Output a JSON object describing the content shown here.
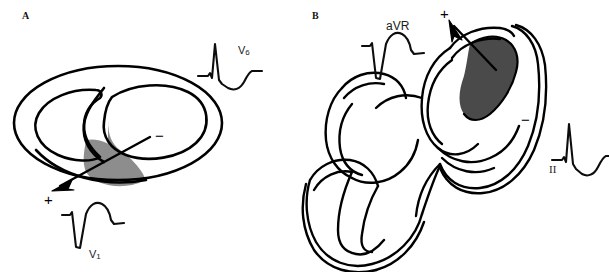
{
  "figure": {
    "background_color": "#ffffff",
    "ink_color": "#000000",
    "width": 609,
    "height": 272
  },
  "panels": [
    {
      "letter": "A",
      "name": "short-axis-cross-section",
      "view": "short-axis ventricular cross-section",
      "infarct": {
        "name": "septal-infarct-region",
        "fill_color": "#8d8d8d",
        "location": "septum / inferoseptal wall"
      },
      "vector": {
        "name": "depolarization-vector",
        "direction": "inferolateral, down-left",
        "positive_label": "+",
        "negative_label": "−"
      },
      "ecgs": [
        {
          "lead": "V",
          "subscript": "6",
          "name": "ecg-trace-v6",
          "morphology": "tall upright R wave with S descent and positive T wave",
          "deflection": "positive"
        },
        {
          "lead": "V",
          "subscript": "1",
          "name": "ecg-trace-v1",
          "morphology": "deep negative QS complex with broad positive T wave",
          "deflection": "negative"
        }
      ]
    },
    {
      "letter": "B",
      "name": "long-axis-helical-view",
      "view": "long-axis helical ventricular band view",
      "infarct": {
        "name": "basal-infarct-region",
        "fill_color": "#4a4a4a",
        "location": "basal anterolateral wall"
      },
      "vector": {
        "name": "depolarization-vector",
        "direction": "superior, up-left",
        "positive_label": "+",
        "negative_label": "−"
      },
      "ecgs": [
        {
          "lead": "aVR",
          "subscript": "",
          "name": "ecg-trace-avr",
          "morphology": "deep negative QS complex with rounded T wave",
          "deflection": "negative"
        },
        {
          "lead": "II",
          "subscript": "",
          "name": "ecg-trace-ii",
          "morphology": "tall upright R wave with S dip and positive T wave",
          "deflection": "positive"
        }
      ]
    }
  ],
  "labels": {
    "panel_a": "A",
    "panel_b": "B",
    "v6_lead": "V",
    "v6_sub": "6",
    "v1_lead": "V",
    "v1_sub": "1",
    "avr_lead": "aVR",
    "ii_lead": "II",
    "plus": "+",
    "minus": "−"
  }
}
